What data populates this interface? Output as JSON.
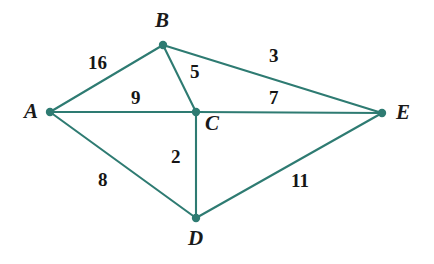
{
  "figure": {
    "type": "weighted-undirected-graph",
    "background_color": "#ffffff",
    "edge_color": "#2e7b72",
    "node_color": "#2e7b72",
    "label_color": "#1a1a1a"
  },
  "nodes": [
    {
      "id": "A",
      "label": "A",
      "x": 50,
      "y": 112,
      "label_x": 24,
      "label_y": 101
    },
    {
      "id": "B",
      "label": "B",
      "x": 163,
      "y": 45,
      "label_x": 155,
      "label_y": 10
    },
    {
      "id": "C",
      "label": "C",
      "x": 196,
      "y": 112,
      "label_x": 205,
      "label_y": 113
    },
    {
      "id": "D",
      "label": "D",
      "x": 196,
      "y": 218,
      "label_x": 188,
      "label_y": 228
    },
    {
      "id": "E",
      "label": "E",
      "x": 382,
      "y": 113,
      "label_x": 396,
      "label_y": 102
    }
  ],
  "edges": [
    {
      "id": "A-B",
      "source": "A",
      "target": "B",
      "weight": "16",
      "label_x": 88,
      "label_y": 53
    },
    {
      "id": "A-C",
      "source": "A",
      "target": "C",
      "weight": "9",
      "label_x": 131,
      "label_y": 88
    },
    {
      "id": "A-D",
      "source": "A",
      "target": "D",
      "weight": "8",
      "label_x": 98,
      "label_y": 170
    },
    {
      "id": "B-C",
      "source": "B",
      "target": "C",
      "weight": "5",
      "label_x": 190,
      "label_y": 62
    },
    {
      "id": "B-E",
      "source": "B",
      "target": "E",
      "weight": "3",
      "label_x": 269,
      "label_y": 46
    },
    {
      "id": "C-E",
      "source": "C",
      "target": "E",
      "weight": "7",
      "label_x": 269,
      "label_y": 88
    },
    {
      "id": "C-D",
      "source": "C",
      "target": "D",
      "weight": "2",
      "label_x": 171,
      "label_y": 147
    },
    {
      "id": "D-E",
      "source": "D",
      "target": "E",
      "weight": "11",
      "label_x": 291,
      "label_y": 171
    }
  ]
}
